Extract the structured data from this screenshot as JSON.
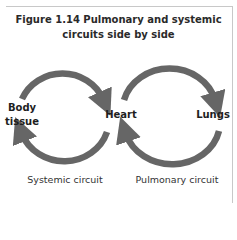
{
  "figure": {
    "title_line1": "Figure 1.14 Pulmonary and systemic",
    "title_line2": "circuits side by side"
  },
  "nodes": {
    "body_tissue_line1": "Body",
    "body_tissue_line2": "tissue",
    "heart": "Heart",
    "lungs": "Lungs"
  },
  "circuits": {
    "systemic": "Systemic circuit",
    "pulmonary": "Pulmonary circuit"
  },
  "colors": {
    "arrow": "#666666",
    "frame": "#c8c8c8",
    "text": "#2a2a2a"
  }
}
